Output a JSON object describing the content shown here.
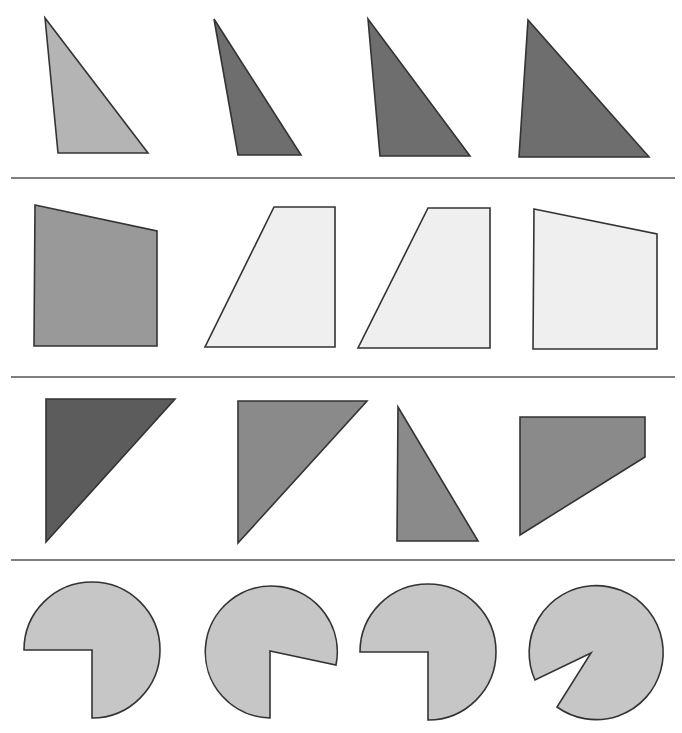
{
  "diagram": {
    "type": "shape-comparison-worksheet",
    "rows": [
      {
        "name": "row-1-triangles",
        "shapes": [
          {
            "kind": "triangle",
            "fill": "#b4b4b4",
            "points": [
              [
                45,
                18
              ],
              [
                58,
                153
              ],
              [
                148,
                153
              ]
            ]
          },
          {
            "kind": "triangle",
            "fill": "#6e6e6e",
            "points": [
              [
                214,
                19
              ],
              [
                238,
                155
              ],
              [
                301,
                155
              ]
            ]
          },
          {
            "kind": "triangle",
            "fill": "#6e6e6e",
            "points": [
              [
                368,
                19
              ],
              [
                380,
                156
              ],
              [
                470,
                156
              ]
            ]
          },
          {
            "kind": "triangle",
            "fill": "#6e6e6e",
            "points": [
              [
                528,
                20
              ],
              [
                519,
                157
              ],
              [
                649,
                157
              ]
            ]
          }
        ]
      },
      {
        "name": "row-2-quadrilaterals",
        "shapes": [
          {
            "kind": "quadrilateral",
            "fill": "#999999",
            "points": [
              [
                35,
                205
              ],
              [
                157,
                231
              ],
              [
                157,
                346
              ],
              [
                34,
                346
              ]
            ]
          },
          {
            "kind": "quadrilateral",
            "fill": "#efefef",
            "points": [
              [
                274,
                207
              ],
              [
                335,
                207
              ],
              [
                335,
                347
              ],
              [
                205,
                347
              ]
            ]
          },
          {
            "kind": "quadrilateral",
            "fill": "#efefef",
            "points": [
              [
                428,
                208
              ],
              [
                490,
                208
              ],
              [
                490,
                348
              ],
              [
                358,
                348
              ]
            ]
          },
          {
            "kind": "quadrilateral",
            "fill": "#efefef",
            "points": [
              [
                534,
                209
              ],
              [
                657,
                234
              ],
              [
                657,
                349
              ],
              [
                533,
                349
              ]
            ]
          }
        ]
      },
      {
        "name": "row-3-mixed",
        "shapes": [
          {
            "kind": "triangle",
            "fill": "#5c5c5c",
            "points": [
              [
                46,
                399
              ],
              [
                175,
                399
              ],
              [
                46,
                542
              ]
            ]
          },
          {
            "kind": "triangle",
            "fill": "#8a8a8a",
            "points": [
              [
                238,
                401
              ],
              [
                367,
                401
              ],
              [
                238,
                543
              ]
            ]
          },
          {
            "kind": "triangle",
            "fill": "#8a8a8a",
            "points": [
              [
                398,
                407
              ],
              [
                478,
                541
              ],
              [
                397,
                541
              ]
            ]
          },
          {
            "kind": "quadrilateral",
            "fill": "#8a8a8a",
            "points": [
              [
                520,
                417
              ],
              [
                645,
                417
              ],
              [
                645,
                457
              ],
              [
                520,
                535
              ]
            ]
          }
        ]
      },
      {
        "name": "row-4-pie-wedges",
        "shapes": [
          {
            "kind": "pie",
            "fill": "#c6c6c6",
            "path": "M 92 650 L 24 650 A 68 68 0 1 1 92 718 Z"
          },
          {
            "kind": "pie",
            "fill": "#c6c6c6",
            "path": "M 270 651 L 336 665 A 66 66 0 1 0 270 718 Z"
          },
          {
            "kind": "pie",
            "fill": "#c6c6c6",
            "path": "M 428 652 L 360 652 A 68 68 0 1 1 428 720 Z"
          },
          {
            "kind": "pie",
            "fill": "#c6c6c6",
            "path": "M 591 653 L 535 680 A 67 67 0 1 1 557 707 Z"
          }
        ]
      }
    ],
    "separators": [
      {
        "x1": 11,
        "y1": 178,
        "x2": 675,
        "y2": 178
      },
      {
        "x1": 11,
        "y1": 377,
        "x2": 675,
        "y2": 377
      },
      {
        "x1": 11,
        "y1": 560,
        "x2": 675,
        "y2": 560
      }
    ],
    "colors": {
      "background": "#ffffff",
      "stroke": "#333333",
      "rule": "#555555"
    }
  }
}
